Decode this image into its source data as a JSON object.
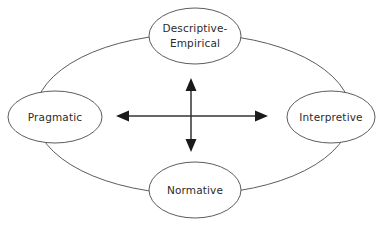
{
  "diagram": {
    "background_color": "#ffffff",
    "outline_color": "#4a4a4a",
    "text_color": "#2b2b2b",
    "arrow_color": "#1a1a1a",
    "nodes": [
      {
        "id": "descriptive-empirical",
        "position": "top",
        "label_line1": "Descriptive-",
        "label_line2": "Empirical",
        "cx": 195,
        "cy": 36,
        "rx": 46,
        "ry": 28
      },
      {
        "id": "pragmatic",
        "position": "left",
        "label_line1": "Pragmatic",
        "label_line2": "",
        "cx": 55,
        "cy": 117,
        "rx": 47,
        "ry": 26
      },
      {
        "id": "interpretive",
        "position": "right",
        "label_line1": "Interpretive",
        "label_line2": "",
        "cx": 331,
        "cy": 117,
        "rx": 44,
        "ry": 26
      },
      {
        "id": "normative",
        "position": "bottom",
        "label_line1": "Normative",
        "label_line2": "",
        "cx": 195,
        "cy": 190,
        "rx": 46,
        "ry": 28
      }
    ],
    "ring": {
      "id": "outer-ellipse",
      "cx": 193,
      "cy": 114,
      "rx": 158,
      "ry": 80
    },
    "axes": [
      {
        "id": "horizontal-double-arrow",
        "orientation": "horizontal",
        "x1": 116,
        "y1": 116,
        "x2": 268,
        "y2": 116
      },
      {
        "id": "vertical-double-arrow",
        "orientation": "vertical",
        "x1": 191,
        "y1": 78,
        "x2": 191,
        "y2": 152
      }
    ]
  }
}
